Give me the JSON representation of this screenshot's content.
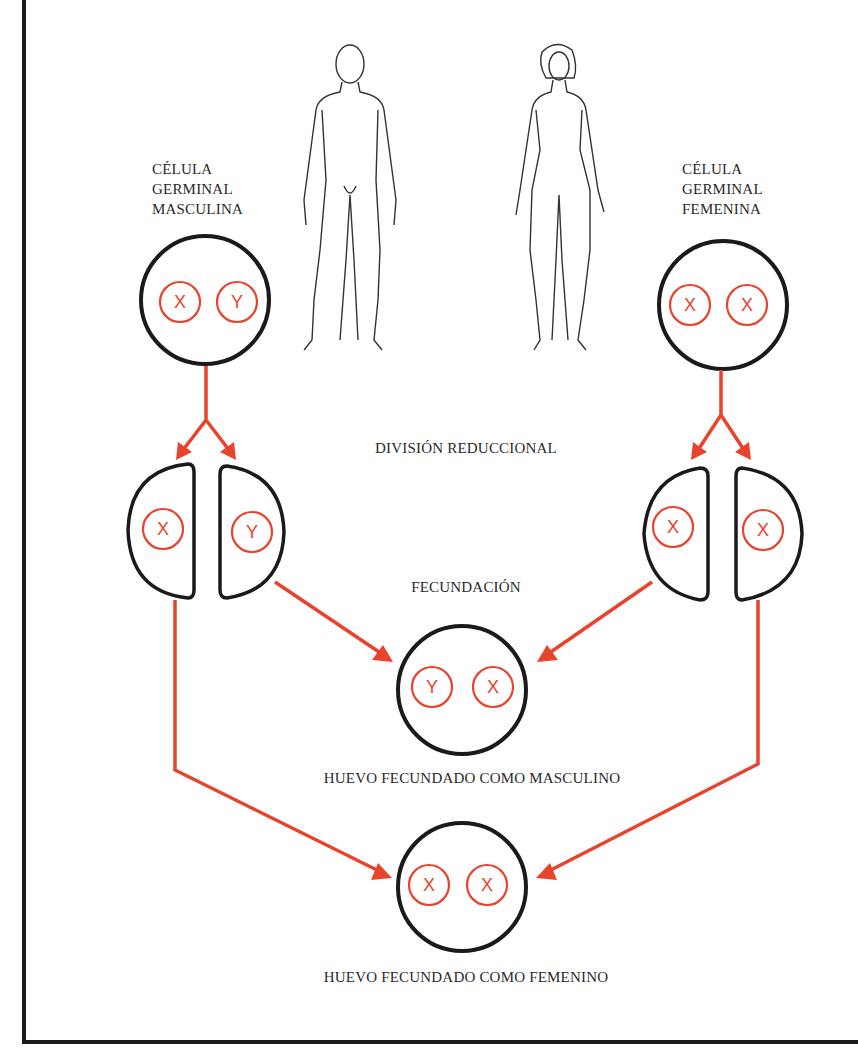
{
  "colors": {
    "outline": "#1a1a1a",
    "arrow": "#e8432c",
    "chromosome": "#e8432c",
    "text": "#2a2a2a",
    "background": "#ffffff"
  },
  "figures": {
    "male": "male-figure",
    "female": "female-figure"
  },
  "labels": {
    "male_germ_cell": [
      "CÉLULA",
      "GERMINAL",
      "MASCULINA"
    ],
    "female_germ_cell": [
      "CÉLULA",
      "GERMINAL",
      "FEMENINA"
    ],
    "reduction_division": "DIVISIÓN REDUCCIONAL",
    "fertilization": "FECUNDACIÓN",
    "male_zygote": "HUEVO FECUNDADO COMO MASCULINO",
    "female_zygote": "HUEVO FECUNDADO COMO FEMENINO"
  },
  "cells": {
    "male_germ": {
      "chromosomes": [
        "X",
        "Y"
      ]
    },
    "female_germ": {
      "chromosomes": [
        "X",
        "X"
      ]
    },
    "male_gametes": [
      {
        "chromosome": "X"
      },
      {
        "chromosome": "Y"
      }
    ],
    "female_gametes": [
      {
        "chromosome": "X"
      },
      {
        "chromosome": "X"
      }
    ],
    "male_zygote": {
      "chromosomes": [
        "Y",
        "X"
      ]
    },
    "female_zygote": {
      "chromosomes": [
        "X",
        "X"
      ]
    }
  }
}
